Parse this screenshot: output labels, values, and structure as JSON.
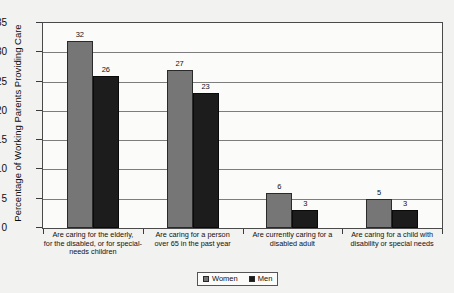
{
  "chart_data": {
    "type": "bar",
    "title": "",
    "xlabel": "",
    "ylabel": "Percentage of Working Parents Providing Care",
    "ylim": [
      0,
      35
    ],
    "ytick_labels": [
      "0",
      "5",
      "10",
      "15",
      "20",
      "25",
      "30",
      "35"
    ],
    "ytick_values": [
      0,
      5,
      10,
      15,
      20,
      25,
      30,
      35
    ],
    "grid": true,
    "legend_position": "bottom-center",
    "categories": [
      "Are caring for the elderly, for the disabled, or for special-needs children",
      "Are caring for a person over 65 in the past year",
      "Are currently caring for a disabled adult",
      "Are caring for a child with disability or special needs"
    ],
    "category_lines": [
      [
        "Are caring for the elderly,",
        "for the disabled, or for special-",
        "needs children"
      ],
      [
        "Are caring for a person",
        "over 65 in the past year"
      ],
      [
        "Are currently caring for a",
        "disabled adult"
      ],
      [
        "Are caring for a child with",
        "disability or special needs"
      ]
    ],
    "series": [
      {
        "name": "Women",
        "color": "#767676",
        "values": [
          32,
          27,
          6,
          5
        ]
      },
      {
        "name": "Men",
        "color": "#1c1c1c",
        "values": [
          26,
          23,
          3,
          3
        ]
      }
    ]
  },
  "legend": {
    "entries": [
      {
        "label": "Women"
      },
      {
        "label": "Men"
      }
    ]
  },
  "title_remnant": ""
}
